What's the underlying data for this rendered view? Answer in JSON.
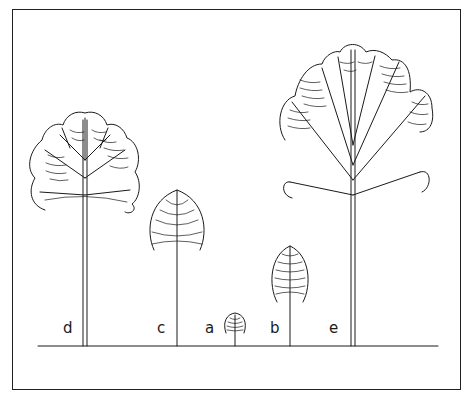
{
  "figure": {
    "labels": {
      "d": "d",
      "c": "c",
      "a": "a",
      "b": "b",
      "e": "e"
    },
    "colors": {
      "line": "#1a1a1a",
      "background": "#ffffff"
    }
  }
}
